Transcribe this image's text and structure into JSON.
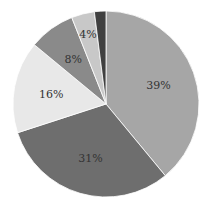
{
  "chart_data": {
    "type": "pie",
    "title": "",
    "categories": [
      "A",
      "B",
      "C",
      "D",
      "E",
      "F"
    ],
    "values": [
      39,
      31,
      16,
      8,
      4,
      2
    ],
    "labels": [
      "39%",
      "31%",
      "16%",
      "8%",
      "4%",
      ""
    ],
    "colors": [
      "#a6a6a6",
      "#6e6e6e",
      "#e8e8e8",
      "#8a8a8a",
      "#c8c8c8",
      "#404040"
    ],
    "start_angle": "12 o'clock",
    "direction": "clockwise",
    "legend": "none"
  }
}
